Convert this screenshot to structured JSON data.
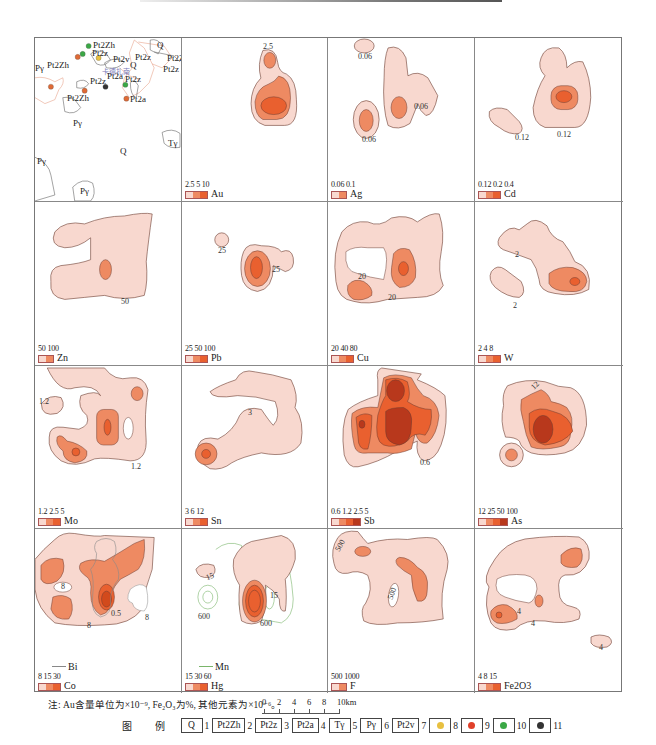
{
  "figure": {
    "colors": {
      "level1": "#f8d8cf",
      "level2": "#ee8a62",
      "level3": "#e9602f",
      "level4": "#b8381c",
      "contour": "#6b3b30",
      "overlay_line_bi": "#888888",
      "overlay_line_mn": "#7ab56a",
      "geo_boundary": "#e8a48c"
    },
    "geology_panel": {
      "labels": [
        "Pt2Zh",
        "Pt2z",
        "Pt2v",
        "Pt2z",
        "Q",
        "Pt2Zh",
        "Pγ",
        "Pt2Zh",
        "Pt2z",
        "Pt2a",
        "Pt2z",
        "Pt2Zh",
        "Pt2a",
        "Pt2z",
        "Pγ",
        "Tγ",
        "Q",
        "Pγ",
        "Pγ",
        "Pt2Zh",
        "Q",
        "Pt2z"
      ],
      "place_name": "卡德扎南"
    },
    "panels": [
      {
        "id": "geology",
        "element": "",
        "legend_values": "",
        "contour_labels": []
      },
      {
        "id": "au",
        "element": "Au",
        "legend_values": "2.5 5 10",
        "levels": 3,
        "contour_labels": [
          "2.5"
        ]
      },
      {
        "id": "ag",
        "element": "Ag",
        "legend_values": "0.06 0.1",
        "levels": 2,
        "contour_labels": [
          "0.06",
          "0.06",
          "0.06"
        ]
      },
      {
        "id": "cd",
        "element": "Cd",
        "legend_values": "0.12 0.2 0.4",
        "levels": 3,
        "contour_labels": [
          "0.12",
          "0.12"
        ]
      },
      {
        "id": "zn",
        "element": "Zn",
        "legend_values": "50 100",
        "levels": 2,
        "contour_labels": [
          "50"
        ]
      },
      {
        "id": "pb",
        "element": "Pb",
        "legend_values": "25 50 100",
        "levels": 3,
        "contour_labels": [
          "25",
          "25"
        ]
      },
      {
        "id": "cu",
        "element": "Cu",
        "legend_values": "20 40 80",
        "levels": 3,
        "contour_labels": [
          "20",
          "20"
        ]
      },
      {
        "id": "w",
        "element": "W",
        "legend_values": "2 4 8",
        "levels": 3,
        "contour_labels": [
          "2",
          "2"
        ]
      },
      {
        "id": "mo",
        "element": "Mo",
        "legend_values": "1.2 2.5 5",
        "levels": 3,
        "contour_labels": [
          "1.2",
          "1.2"
        ]
      },
      {
        "id": "sn",
        "element": "Sn",
        "legend_values": "3 6 12",
        "levels": 3,
        "contour_labels": [
          "3"
        ]
      },
      {
        "id": "sb",
        "element": "Sb",
        "legend_values": "0.6 1.2 2.5 5",
        "levels": 4,
        "contour_labels": [
          "0.6"
        ]
      },
      {
        "id": "as",
        "element": "As",
        "legend_values": "12 25 50 100",
        "levels": 4,
        "contour_labels": [
          "12"
        ]
      },
      {
        "id": "co_bi",
        "element": "Co",
        "line_element": "Bi",
        "legend_values": "8 15 30",
        "levels": 3,
        "contour_labels": [
          "8",
          "8",
          "0.5",
          "8"
        ]
      },
      {
        "id": "hg_mn",
        "element": "Hg",
        "line_element": "Mn",
        "legend_values": "15 30 60",
        "levels": 3,
        "contour_labels": [
          "15",
          "15",
          "600",
          "600"
        ]
      },
      {
        "id": "f",
        "element": "F",
        "legend_values": "500 1000",
        "levels": 2,
        "contour_labels": [
          "500",
          "500"
        ]
      },
      {
        "id": "fe2o3",
        "element": "Fe2O3",
        "legend_values": "4 8 15",
        "levels": 3,
        "contour_labels": [
          "4",
          "4",
          "4"
        ]
      }
    ],
    "note": "注:  Au含量单位为×10⁻⁹,  Fe₂O₃为%,  其他元素为×10⁻⁶。",
    "scale_bar": {
      "ticks": [
        "0",
        "2",
        "4",
        "6",
        "8",
        "10km"
      ]
    },
    "legend_key": {
      "title": "图 例",
      "items": [
        {
          "symbol": "Q",
          "num": "1",
          "type": "box"
        },
        {
          "symbol": "Pt2Zh",
          "num": "2",
          "type": "box"
        },
        {
          "symbol": "Pt2z",
          "num": "3",
          "type": "box"
        },
        {
          "symbol": "Pt2a",
          "num": "4",
          "type": "box"
        },
        {
          "symbol": "Tγ",
          "num": "5",
          "type": "box"
        },
        {
          "symbol": "Pγ",
          "num": "6",
          "type": "box"
        },
        {
          "symbol": "Pt2v",
          "num": "7",
          "type": "box"
        },
        {
          "symbol": "dot",
          "color": "#e8c040",
          "num": "8",
          "type": "dot"
        },
        {
          "symbol": "dot",
          "color": "#e0402a",
          "num": "9",
          "type": "dot"
        },
        {
          "symbol": "dot",
          "color": "#3aa845",
          "num": "10",
          "type": "dot"
        },
        {
          "symbol": "dot",
          "color": "#333333",
          "num": "11",
          "type": "dot"
        }
      ]
    }
  }
}
